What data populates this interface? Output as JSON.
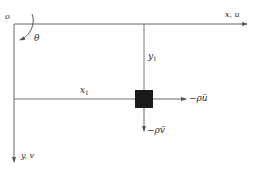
{
  "diagram": {
    "type": "coordinate-system-free-body",
    "labels": {
      "origin": "o",
      "angle": "θ",
      "x_axis": "x, u",
      "y_axis": "y, v",
      "x1": "x",
      "x1_sub": "1",
      "y1": "y",
      "y1_sub": "1",
      "force_x": "−ρü",
      "force_y": "−ρv̈"
    },
    "colors": {
      "line": "#555555",
      "mass": "#1a1a1a",
      "text": "#2a2a2a",
      "background": "#ffffff"
    }
  }
}
